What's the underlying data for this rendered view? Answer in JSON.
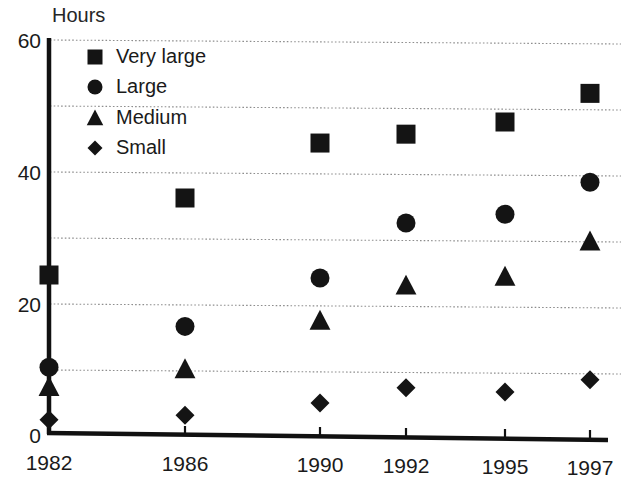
{
  "chart_data": {
    "type": "scatter",
    "title": "",
    "subtitle": "",
    "xlabel": "",
    "ylabel": "Hours",
    "categories": [
      "1982",
      "1986",
      "1990",
      "1992",
      "1995",
      "1997"
    ],
    "x": [
      1982,
      1986,
      1990,
      1992,
      1995,
      1997
    ],
    "ylim": [
      0,
      60
    ],
    "yticks": [
      0,
      20,
      40,
      60
    ],
    "ytick_labels": [
      "0",
      "20",
      "40",
      "60"
    ],
    "gridlines_y": [
      10,
      20,
      30,
      40,
      50,
      60
    ],
    "grid": true,
    "legend_position": "upper-left-inside",
    "series": [
      {
        "name": "Very large",
        "marker": "square",
        "color": "#141414",
        "values": [
          24,
          36,
          44.5,
          46,
          48,
          52.5
        ]
      },
      {
        "name": "Large",
        "marker": "circle",
        "color": "#141414",
        "values": [
          10,
          16.5,
          24,
          32.5,
          34,
          39
        ]
      },
      {
        "name": "Medium",
        "marker": "triangle",
        "color": "#141414",
        "values": [
          7,
          10,
          17.5,
          23,
          24.5,
          30
        ]
      },
      {
        "name": "Small",
        "marker": "diamond",
        "color": "#141414",
        "values": [
          2,
          3,
          5,
          7.5,
          7,
          9
        ]
      }
    ]
  },
  "axes": {
    "y_title": "Hours",
    "y_tick_0": "0",
    "y_tick_20": "20",
    "y_tick_40": "40",
    "y_tick_60": "60",
    "x_tick_0": "1982",
    "x_tick_1": "1986",
    "x_tick_2": "1990",
    "x_tick_3": "1992",
    "x_tick_4": "1995",
    "x_tick_5": "1997"
  },
  "legend": {
    "items": [
      {
        "label": "Very large",
        "marker": "square"
      },
      {
        "label": "Large",
        "marker": "circle"
      },
      {
        "label": "Medium",
        "marker": "triangle"
      },
      {
        "label": "Small",
        "marker": "diamond"
      }
    ]
  }
}
